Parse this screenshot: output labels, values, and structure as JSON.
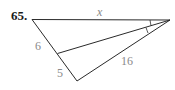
{
  "problem": {
    "number": "65."
  },
  "diagram": {
    "labels": {
      "top_side": "x",
      "left_upper_segment": "6",
      "left_lower_segment": "5",
      "right_side": "16"
    },
    "colors": {
      "lines": "#2a2a2a",
      "labels": "#8a8a8a",
      "number": "#1a1a1a"
    }
  }
}
